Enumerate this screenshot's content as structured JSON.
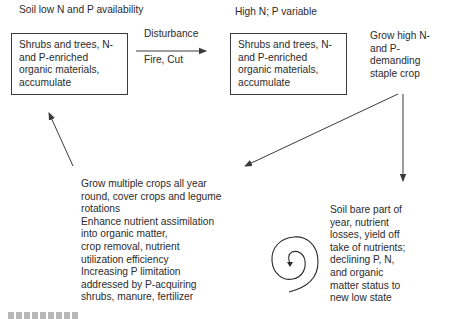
{
  "diagram": {
    "labels": {
      "soil_low": "Soil low N and P availability",
      "high_n": "High N; P variable",
      "disturbance": "Disturbance",
      "fire_cut": "Fire, Cut"
    },
    "box_left": {
      "text": "Shrubs and trees, N-\nand P-enriched\norganic materials,\naccumulate"
    },
    "box_right": {
      "text": "Shrubs and trees, N-\nand P-enriched\norganic materials,\naccumulate"
    },
    "grow_staple": "Grow high N-\nand P-\ndemanding\nstaple crop",
    "soil_bare": "Soil bare part of\nyear, nutrient\nlosses, yield off\ntake of nutrients;\ndeclining P, N,\nand organic\nmatter status to\nnew low state",
    "grow_multiple": "Grow multiple crops all year\nround, cover crops and legume\nrotations\nEnhance nutrient assimilation\ninto organic matter,\ncrop removal, nutrient\nutilization efficiency\nIncreasing P limitation\naddressed by P-acquiring\nshrubs, manure, fertilizer",
    "colors": {
      "line": "#3a3a3a",
      "text": "#2b2b2b",
      "background": "#ffffff"
    }
  }
}
